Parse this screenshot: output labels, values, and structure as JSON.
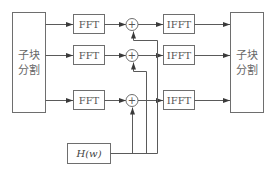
{
  "diagram": {
    "left_block": {
      "line1": "子块",
      "line2": "分割"
    },
    "right_block": {
      "line1": "子块",
      "line2": "分割"
    },
    "fft_blocks": [
      "FFT",
      "FFT",
      "FFT"
    ],
    "ifft_blocks": [
      "IFFT",
      "IFFT",
      "IFFT"
    ],
    "adders": [
      "+",
      "+",
      "+"
    ],
    "filter_block": {
      "label": "H(w)"
    },
    "colors": {
      "stroke": "#6e6e6e",
      "text": "#555555",
      "background": "#ffffff"
    }
  }
}
